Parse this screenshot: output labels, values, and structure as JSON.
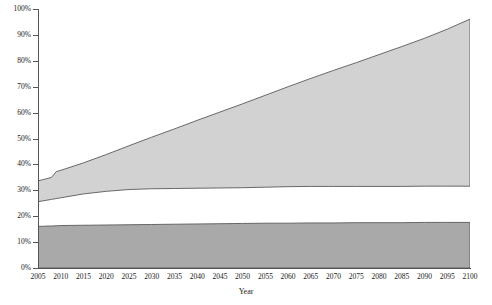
{
  "chart_data": {
    "type": "area",
    "title": "",
    "subtitle": "",
    "xlabel": "Year",
    "ylabel": "",
    "xlim": [
      2005,
      2100
    ],
    "ylim": [
      0,
      100
    ],
    "grid": false,
    "legend_position": "none",
    "x_tick_labels": [
      "2005",
      "2010",
      "2015",
      "2020",
      "2025",
      "2030",
      "2035",
      "2040",
      "2045",
      "2050",
      "2055",
      "2060",
      "2065",
      "2070",
      "2075",
      "2080",
      "2085",
      "2090",
      "2095",
      "2100"
    ],
    "y_tick_labels": [
      "0%",
      "10%",
      "20%",
      "30%",
      "40%",
      "50%",
      "60%",
      "70%",
      "80%",
      "90%",
      "100%"
    ],
    "x": [
      2005,
      2006,
      2007,
      2008,
      2009,
      2010,
      2015,
      2020,
      2025,
      2030,
      2035,
      2040,
      2045,
      2050,
      2055,
      2060,
      2065,
      2070,
      2075,
      2080,
      2085,
      2090,
      2095,
      2100
    ],
    "series": [
      {
        "name": "lower-dark-band",
        "color": "#a9a9a9",
        "lower_values": [
          0,
          0,
          0,
          0,
          0,
          0,
          0,
          0,
          0,
          0,
          0,
          0,
          0,
          0,
          0,
          0,
          0,
          0,
          0,
          0,
          0,
          0,
          0,
          0
        ],
        "upper_values": [
          16.1,
          16.1,
          16.2,
          16.2,
          16.3,
          16.4,
          16.5,
          16.6,
          16.7,
          16.8,
          16.9,
          17.0,
          17.1,
          17.2,
          17.3,
          17.3,
          17.4,
          17.4,
          17.5,
          17.5,
          17.5,
          17.6,
          17.6,
          17.6
        ]
      },
      {
        "name": "upper-light-band",
        "color": "#d2d2d2",
        "lower_values": [
          25.6,
          25.9,
          26.2,
          26.5,
          26.8,
          27.1,
          28.6,
          29.6,
          30.3,
          30.6,
          30.7,
          30.8,
          30.9,
          31.0,
          31.2,
          31.4,
          31.5,
          31.5,
          31.5,
          31.5,
          31.5,
          31.6,
          31.6,
          31.6
        ],
        "upper_values": [
          33.6,
          34.1,
          34.5,
          35.0,
          37.2,
          37.7,
          40.6,
          43.8,
          47.2,
          50.5,
          53.7,
          57.0,
          60.2,
          63.4,
          66.7,
          70.0,
          73.2,
          76.3,
          79.3,
          82.4,
          85.5,
          88.7,
          92.2,
          96.1
        ]
      }
    ]
  },
  "axis": {
    "x_title": "Year"
  }
}
